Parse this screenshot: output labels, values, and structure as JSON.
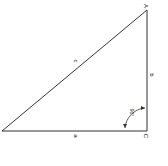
{
  "diagram": {
    "title": "",
    "vertices": {
      "A": "A",
      "C": "C"
    },
    "sides": {
      "a": "a",
      "b": "b",
      "c": "c"
    },
    "angle_label": "90°",
    "colors": {
      "line": "#333333",
      "background": "#ffffff"
    }
  }
}
